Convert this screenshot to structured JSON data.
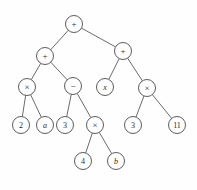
{
  "figure": {
    "kind": "expression-tree-diagram",
    "background_color": "#fefefe",
    "stroke_color": "#5a5a5a",
    "text_color": "#2b2b2b",
    "node_radius": 8.5,
    "width": 197,
    "height": 190
  },
  "nodes": [
    {
      "id": "n0",
      "label": "+",
      "style": "op",
      "cx": 74,
      "cy": 24,
      "name": "node-root-plus"
    },
    {
      "id": "n1",
      "label": "+",
      "style": "op",
      "cx": 45,
      "cy": 56,
      "name": "node-left-plus"
    },
    {
      "id": "n2",
      "label": "+",
      "style": "op",
      "cx": 123,
      "cy": 51,
      "name": "node-right-plus"
    },
    {
      "id": "n3",
      "label": "×",
      "style": "op",
      "cx": 27,
      "cy": 87,
      "name": "node-times-left"
    },
    {
      "id": "n4",
      "label": "−",
      "style": "op",
      "cx": 73,
      "cy": 86,
      "name": "node-minus"
    },
    {
      "id": "n5",
      "label": "x",
      "style": "italic",
      "cx": 105,
      "cy": 87,
      "name": "node-var-x"
    },
    {
      "id": "n6",
      "label": "×",
      "style": "op",
      "cx": 147,
      "cy": 88,
      "name": "node-times-right"
    },
    {
      "id": "n7",
      "label": "2",
      "style": "num",
      "cx": 21,
      "cy": 125,
      "name": "node-leaf-2"
    },
    {
      "id": "n8",
      "label": "a",
      "style": "italic",
      "cx": 45,
      "cy": 125,
      "name": "node-leaf-a"
    },
    {
      "id": "n9",
      "label": "3",
      "style": "num",
      "cx": 65,
      "cy": 125,
      "name": "node-leaf-3-left"
    },
    {
      "id": "n10",
      "label": "×",
      "style": "op",
      "cx": 95,
      "cy": 125,
      "name": "node-times-bottom"
    },
    {
      "id": "n11",
      "label": "3",
      "style": "num",
      "cx": 133,
      "cy": 125,
      "name": "node-leaf-3-right"
    },
    {
      "id": "n12",
      "label": "11",
      "style": "num",
      "cx": 177,
      "cy": 125,
      "name": "node-leaf-11"
    },
    {
      "id": "n13",
      "label": "4",
      "style": "num",
      "cx": 83,
      "cy": 161,
      "name": "node-leaf-4"
    },
    {
      "id": "n14",
      "label": "b",
      "style": "italic",
      "cx": 116,
      "cy": 161,
      "name": "node-leaf-b"
    }
  ],
  "edges": [
    {
      "from": "n0",
      "to": "n1",
      "name": "edge-root-to-left-plus"
    },
    {
      "from": "n0",
      "to": "n2",
      "name": "edge-root-to-right-plus"
    },
    {
      "from": "n1",
      "to": "n3",
      "name": "edge-left-plus-to-times"
    },
    {
      "from": "n1",
      "to": "n4",
      "name": "edge-left-plus-to-minus"
    },
    {
      "from": "n2",
      "to": "n5",
      "name": "edge-right-plus-to-x"
    },
    {
      "from": "n2",
      "to": "n6",
      "name": "edge-right-plus-to-times"
    },
    {
      "from": "n3",
      "to": "n7",
      "name": "edge-times-to-2"
    },
    {
      "from": "n3",
      "to": "n8",
      "name": "edge-times-to-a"
    },
    {
      "from": "n4",
      "to": "n9",
      "name": "edge-minus-to-3"
    },
    {
      "from": "n4",
      "to": "n10",
      "name": "edge-minus-to-times"
    },
    {
      "from": "n6",
      "to": "n11",
      "name": "edge-times-to-3"
    },
    {
      "from": "n6",
      "to": "n12",
      "name": "edge-times-to-11"
    },
    {
      "from": "n10",
      "to": "n13",
      "name": "edge-times-to-4"
    },
    {
      "from": "n10",
      "to": "n14",
      "name": "edge-times-to-b"
    }
  ]
}
